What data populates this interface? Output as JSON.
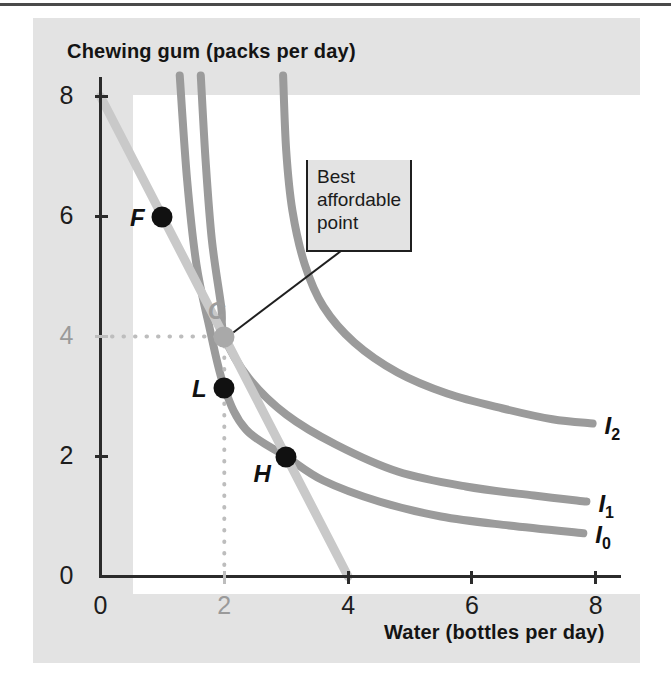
{
  "figure": {
    "y_axis_title": "Chewing gum (packs per day)",
    "x_axis_title": "Water (bottles per day)",
    "callout": {
      "line1": "Best",
      "line2": "affordable",
      "line3": "point"
    },
    "colors": {
      "panel_background": "#e3e3e3",
      "plot_background": "#ffffff",
      "axis": "#2b2b2b",
      "indifference_curve": "#9b9b9b",
      "budget_line": "#c9c9c9",
      "point_dark": "#111111",
      "point_highlight": "#a9a9a9",
      "guideline": "#bdbdbd",
      "callout_border": "#1f1f1f"
    }
  },
  "chart_data": {
    "type": "line",
    "title": "Best affordable point",
    "xlabel": "Water (bottles per day)",
    "ylabel": "Chewing gum (packs per day)",
    "xlim": [
      0,
      8.7
    ],
    "ylim": [
      0,
      8.35
    ],
    "xticks": [
      0,
      2,
      4,
      6,
      8
    ],
    "yticks": [
      0,
      2,
      4,
      6,
      8
    ],
    "xtick_labels": [
      "0",
      "2",
      "4",
      "6",
      "8"
    ],
    "ytick_labels": [
      "0",
      "2",
      "4",
      "6",
      "8"
    ],
    "muted_xtick": "2",
    "muted_ytick": "4",
    "grid": false,
    "legend_position": "curve-end-right",
    "series": [
      {
        "name": "I0",
        "label": "I",
        "sublabel": "0",
        "kind": "indifference-curve",
        "points": [
          [
            1.28,
            8.35
          ],
          [
            1.4,
            6.6
          ],
          [
            1.55,
            5.2
          ],
          [
            1.75,
            4.2
          ],
          [
            2.0,
            3.15
          ],
          [
            2.35,
            2.45
          ],
          [
            3.0,
            2.0
          ],
          [
            3.6,
            1.6
          ],
          [
            4.5,
            1.25
          ],
          [
            5.5,
            1.0
          ],
          [
            6.6,
            0.85
          ],
          [
            7.8,
            0.72
          ]
        ]
      },
      {
        "name": "I1",
        "label": "I",
        "sublabel": "1",
        "kind": "indifference-curve",
        "points": [
          [
            1.62,
            8.35
          ],
          [
            1.7,
            6.9
          ],
          [
            1.8,
            5.6
          ],
          [
            1.95,
            4.5
          ],
          [
            2.0,
            4.0
          ],
          [
            2.4,
            3.3
          ],
          [
            3.0,
            2.7
          ],
          [
            3.8,
            2.2
          ],
          [
            4.8,
            1.75
          ],
          [
            5.9,
            1.5
          ],
          [
            7.0,
            1.35
          ],
          [
            7.85,
            1.25
          ]
        ]
      },
      {
        "name": "I2",
        "label": "I",
        "sublabel": "2",
        "kind": "indifference-curve",
        "points": [
          [
            2.95,
            8.35
          ],
          [
            3.0,
            7.1
          ],
          [
            3.1,
            6.1
          ],
          [
            3.3,
            5.2
          ],
          [
            3.6,
            4.5
          ],
          [
            4.1,
            3.9
          ],
          [
            4.8,
            3.4
          ],
          [
            5.6,
            3.05
          ],
          [
            6.5,
            2.8
          ],
          [
            7.3,
            2.62
          ],
          [
            7.95,
            2.55
          ]
        ]
      },
      {
        "name": "Budget line",
        "kind": "budget-line",
        "points": [
          [
            0,
            8
          ],
          [
            4,
            0
          ]
        ]
      }
    ],
    "points": [
      {
        "name": "F",
        "label": "F",
        "x": 1.0,
        "y": 6.0,
        "style": "dark",
        "on": "I2",
        "label_side": "left"
      },
      {
        "name": "C",
        "label": "C",
        "x": 2.0,
        "y": 4.0,
        "style": "highlight",
        "on": "I1",
        "label_side": "above-left"
      },
      {
        "name": "L",
        "label": "L",
        "x": 2.0,
        "y": 3.15,
        "style": "dark",
        "on": "I0",
        "label_side": "left"
      },
      {
        "name": "H",
        "label": "H",
        "x": 3.0,
        "y": 2.0,
        "style": "dark",
        "on": "I0",
        "label_side": "below-left"
      }
    ],
    "guidelines": [
      {
        "name": "horizontal-guide-to-C",
        "from": [
          0,
          4
        ],
        "to": [
          2,
          4
        ],
        "style": "dotted"
      },
      {
        "name": "vertical-guide-to-C",
        "from": [
          2,
          0
        ],
        "to": [
          2,
          4
        ],
        "style": "dotted"
      }
    ],
    "annotations": [
      {
        "name": "best-affordable-point-callout",
        "text": "Best affordable point",
        "target": [
          2,
          4
        ]
      }
    ]
  }
}
